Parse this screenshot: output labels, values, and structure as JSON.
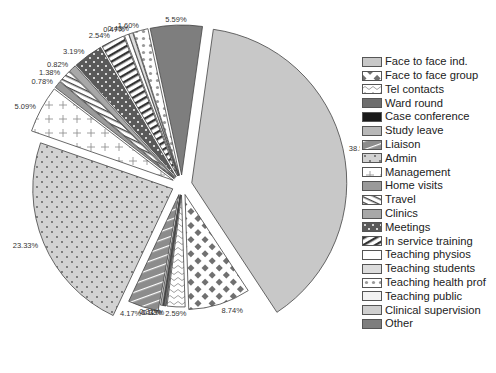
{
  "chart_data": {
    "type": "pie",
    "title": "",
    "start_angle_deg": 8,
    "direction": "clockwise",
    "exploded": true,
    "legend_position": "right",
    "slices": [
      {
        "label": "Face to face ind.",
        "value": 38.52,
        "display": "38.52%",
        "color": "#c8c8c8",
        "pattern": "solid"
      },
      {
        "label": "Face to face group",
        "value": 8.74,
        "display": "8.74%",
        "color": "#ffffff",
        "pattern": "checker",
        "pcolor": "#707070"
      },
      {
        "label": "Tel contacts",
        "value": 2.59,
        "display": "2.59%",
        "color": "#ffffff",
        "pattern": "wave",
        "pcolor": "#777"
      },
      {
        "label": "Ward round",
        "value": 0.33,
        "display": "0.33%",
        "color": "#6e6e6e",
        "pattern": "solid"
      },
      {
        "label": "Case conference",
        "value": 0.12,
        "display": "0.12%",
        "color": "#1a1a1a",
        "pattern": "solid"
      },
      {
        "label": "Study leave",
        "value": 0.31,
        "display": "0.31%",
        "color": "#b8b8b8",
        "pattern": "solid"
      },
      {
        "label": "Liaison",
        "value": 4.17,
        "display": "4.17%",
        "color": "#8c8c8c",
        "pattern": "diag-white",
        "pcolor": "#ffffff"
      },
      {
        "label": "Admin",
        "value": 23.33,
        "display": "23.33%",
        "color": "#d2d2d2",
        "pattern": "dots",
        "pcolor": "#555"
      },
      {
        "label": "Management",
        "value": 5.09,
        "display": "5.09%",
        "color": "#ffffff",
        "pattern": "plus",
        "pcolor": "#888"
      },
      {
        "label": "Home visits",
        "value": 0.78,
        "display": "0.78%",
        "color": "#9a9a9a",
        "pattern": "solid"
      },
      {
        "label": "Travel",
        "value": 1.38,
        "display": "1.38%",
        "color": "#ffffff",
        "pattern": "diag-dark",
        "pcolor": "#444"
      },
      {
        "label": "Clinics",
        "value": 0.82,
        "display": "0.82%",
        "color": "#a8a8a8",
        "pattern": "solid"
      },
      {
        "label": "Meetings",
        "value": 3.19,
        "display": "3.19%",
        "color": "#5a5a5a",
        "pattern": "dots-white",
        "pcolor": "#ffffff"
      },
      {
        "label": "In service training",
        "value": 2.54,
        "display": "2.54%",
        "color": "#ffffff",
        "pattern": "hstripe",
        "pcolor": "#333"
      },
      {
        "label": "Teaching physios",
        "value": 0.47,
        "display": "0.47%",
        "color": "#ffffff",
        "pattern": "solid"
      },
      {
        "label": "Teaching students",
        "value": 0.43,
        "display": "0.43%",
        "color": "#dcdcdc",
        "pattern": "solid"
      },
      {
        "label": "Teaching health prof",
        "value": 1.6,
        "display": "1.60%",
        "color": "#ffffff",
        "pattern": "dots-big",
        "pcolor": "#999"
      },
      {
        "label": "Teaching public",
        "value": 0,
        "display": "",
        "color": "#f2f2f2",
        "pattern": "solid"
      },
      {
        "label": "Clinical supervision",
        "value": 0,
        "display": "",
        "color": "#cfcfcf",
        "pattern": "solid"
      },
      {
        "label": "Other",
        "value": 5.59,
        "display": "5.59%",
        "color": "#7e7e7e",
        "pattern": "solid"
      }
    ]
  },
  "legend": {
    "items": [
      "Face to face ind.",
      "Face to face group",
      "Tel contacts",
      "Ward round",
      "Case conference",
      "Study leave",
      "Liaison",
      "Admin",
      "Management",
      "Home visits",
      "Travel",
      "Clinics",
      "Meetings",
      "In service training",
      "Teaching physios",
      "Teaching students",
      "Teaching health prof",
      "Teaching public",
      "Clinical supervision",
      "Other"
    ]
  }
}
